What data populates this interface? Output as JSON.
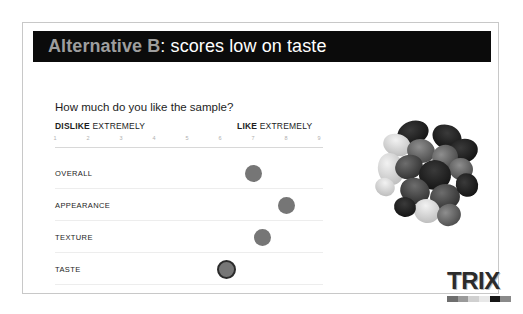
{
  "slide": {
    "title_strong": "Alternative B",
    "title_rest": ": scores low on taste",
    "question": "How much do you like the sample?",
    "anchor_left_strong": "DISLIKE",
    "anchor_left_rest": "EXTREMELY",
    "anchor_right_strong": "LIKE",
    "anchor_right_rest": "EXTREMELY",
    "header_bg": "#0b0b0b",
    "title_strong_color": "#9e9e9e",
    "title_rest_color": "#ffffff",
    "dot_color": "#767676",
    "highlight_ring_color": "#2b2b2b"
  },
  "brand": {
    "name": "TRIX",
    "swatches": [
      "#6e6e6e",
      "#9a9a9a",
      "#d0d0d0",
      "#e8e8e8",
      "#171717",
      "#8a8a8a"
    ]
  },
  "photo": {
    "alt_name": "snack-mix-photo"
  },
  "chart_data": {
    "type": "scatter",
    "title": "How much do you like the sample?",
    "xlabel": "",
    "ylabel": "",
    "xlim": [
      1,
      9
    ],
    "grid": false,
    "legend": "none",
    "tick_labels": [
      "1",
      "2",
      "3",
      "4",
      "5",
      "6",
      "7",
      "8",
      "9"
    ],
    "anchor_low": "DISLIKE EXTREMELY",
    "anchor_high": "LIKE EXTREMELY",
    "categories": [
      "OVERALL",
      "APPEARANCE",
      "TEXTURE",
      "TASTE"
    ],
    "values": [
      7.0,
      8.0,
      7.3,
      6.2
    ],
    "highlighted": [
      "TASTE"
    ],
    "points": [
      {
        "label": "OVERALL",
        "value": 7.0,
        "highlight": false
      },
      {
        "label": "APPEARANCE",
        "value": 8.0,
        "highlight": false
      },
      {
        "label": "TEXTURE",
        "value": 7.3,
        "highlight": false
      },
      {
        "label": "TASTE",
        "value": 6.2,
        "highlight": true
      }
    ]
  }
}
